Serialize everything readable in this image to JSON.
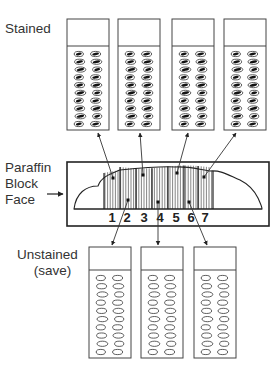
{
  "labels": {
    "stained": "Stained",
    "block_line1": "Paraffin",
    "block_line2": "Block",
    "block_line3": "Face",
    "unstained_line1": "Unstained",
    "unstained_line2": "(save)"
  },
  "section_numbers": [
    "1",
    "2",
    "3",
    "4",
    "5",
    "6",
    "7"
  ],
  "stained_slides": [
    {
      "id": "stained-slide-1",
      "section": "1"
    },
    {
      "id": "stained-slide-2",
      "section": "3"
    },
    {
      "id": "stained-slide-3",
      "section": "5"
    },
    {
      "id": "stained-slide-4",
      "section": "7"
    }
  ],
  "unstained_slides": [
    {
      "id": "unstained-slide-1",
      "section": "2"
    },
    {
      "id": "unstained-slide-2",
      "section": "4"
    },
    {
      "id": "unstained-slide-3",
      "section": "6"
    }
  ],
  "colors": {
    "line": "#333333",
    "background": "#ffffff"
  }
}
